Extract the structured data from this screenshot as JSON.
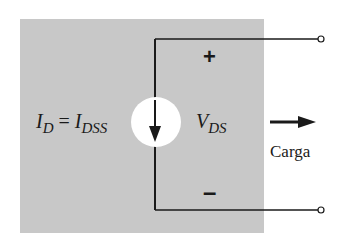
{
  "diagram": {
    "type": "circuit",
    "current_label": {
      "main": "I",
      "sub": "D",
      "eq": " = ",
      "main2": "I",
      "sub2": "DSS"
    },
    "voltage_label": {
      "main": "V",
      "sub": "DS"
    },
    "plus_sign": "+",
    "minus_sign": "–",
    "load_label": "Carga",
    "colors": {
      "background_box": "#c8c8c8",
      "wire": "#1a1a1a",
      "source_fill": "#ffffff"
    }
  }
}
